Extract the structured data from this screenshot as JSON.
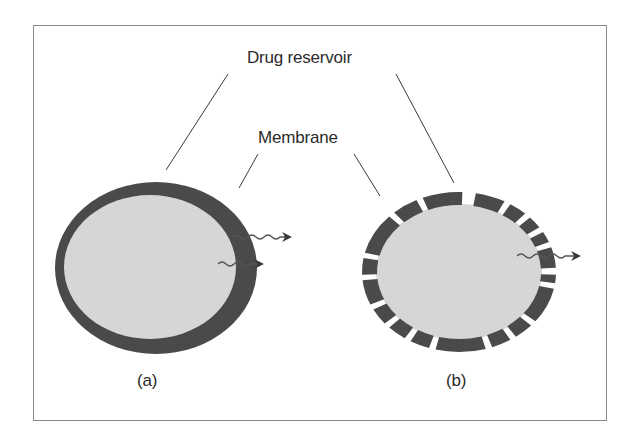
{
  "labels": {
    "drug_reservoir": "Drug reservoir",
    "membrane": "Membrane"
  },
  "captions": {
    "a": "(a)",
    "b": "(b)"
  },
  "colors": {
    "membrane": "#4a4a4a",
    "reservoir": "#d6d6d6",
    "leader_line": "#3a3a3a",
    "frame": "#8a8a8a",
    "arrow": "#3a3a3a"
  },
  "panel_a": {
    "description": "Reservoir device with continuous (non-porous) membrane; drug diffuses through membrane",
    "center": [
      156,
      268
    ],
    "outer_radius": [
      101,
      86
    ],
    "inner_radius": [
      86,
      72
    ],
    "release_arrows": 2
  },
  "panel_b": {
    "description": "Reservoir device with porous (segmented) membrane; drug releases through pores",
    "center": [
      459,
      272
    ],
    "outer_radius": [
      97,
      80
    ],
    "inner_radius": [
      82,
      67
    ],
    "segments_deg": [
      [
        -80,
        -62
      ],
      [
        -58,
        -47
      ],
      [
        -43,
        -34
      ],
      [
        -30,
        -22
      ],
      [
        -18,
        -3
      ],
      [
        2,
        8
      ],
      [
        12,
        38
      ],
      [
        42,
        54
      ],
      [
        58,
        70
      ],
      [
        74,
        104
      ],
      [
        108,
        120
      ],
      [
        124,
        136
      ],
      [
        140,
        152
      ],
      [
        156,
        174
      ],
      [
        178,
        190
      ],
      [
        194,
        224
      ],
      [
        228,
        244
      ],
      [
        248,
        272
      ]
    ],
    "release_arrows": 1
  }
}
